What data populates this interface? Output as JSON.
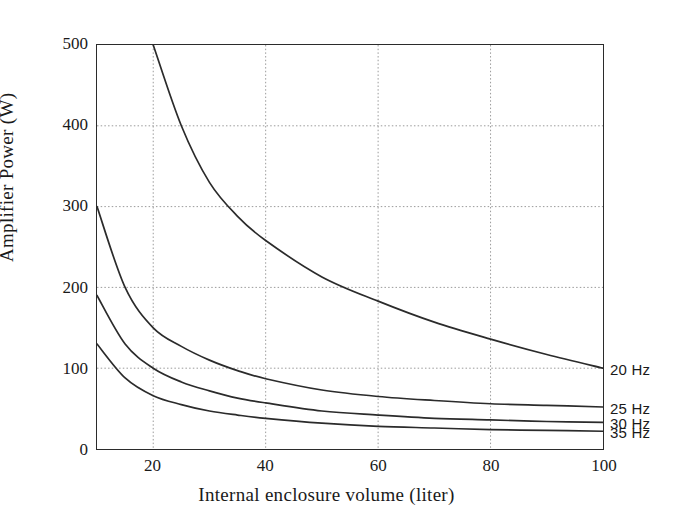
{
  "chart_data": {
    "type": "line",
    "title": "",
    "xlabel": "Internal enclosure volume (liter)",
    "ylabel": "Amplifier Power (W)",
    "xlim": [
      10,
      100
    ],
    "ylim": [
      0,
      500
    ],
    "xticks": [
      20,
      40,
      60,
      80,
      100
    ],
    "yticks": [
      0,
      100,
      200,
      300,
      400,
      500
    ],
    "grid": true,
    "legend_position": "right-of-axis-end-labels",
    "x": [
      10,
      15,
      20,
      25,
      30,
      35,
      40,
      50,
      60,
      70,
      80,
      90,
      100
    ],
    "series": [
      {
        "name": "20 Hz",
        "label": "20 Hz",
        "color": "#2b2b2b",
        "values": [
          null,
          null,
          500,
          400,
          330,
          288,
          258,
          213,
          183,
          157,
          136,
          117,
          100
        ]
      },
      {
        "name": "25 Hz",
        "label": "25 Hz",
        "color": "#2b2b2b",
        "values": [
          300,
          200,
          150,
          127,
          110,
          97,
          87,
          73,
          65,
          60,
          56,
          54,
          52
        ]
      },
      {
        "name": "30 Hz",
        "label": "30 Hz",
        "color": "#2b2b2b",
        "values": [
          190,
          130,
          100,
          83,
          72,
          63,
          57,
          47,
          42,
          38,
          36,
          34,
          33
        ]
      },
      {
        "name": "35 Hz",
        "label": "35 Hz",
        "color": "#2b2b2b",
        "values": [
          130,
          88,
          66,
          55,
          47,
          42,
          38,
          32,
          28,
          26,
          24,
          23,
          22
        ]
      }
    ],
    "label_anchor_values": {
      "20 Hz": 100,
      "25 Hz": 52,
      "30 Hz": 33,
      "35 Hz": 22
    }
  },
  "style": {
    "axis_color": "#2b2b2b",
    "grid_color": "#9a9a9a",
    "curve_color": "#2b2b2b",
    "background": "#ffffff"
  }
}
